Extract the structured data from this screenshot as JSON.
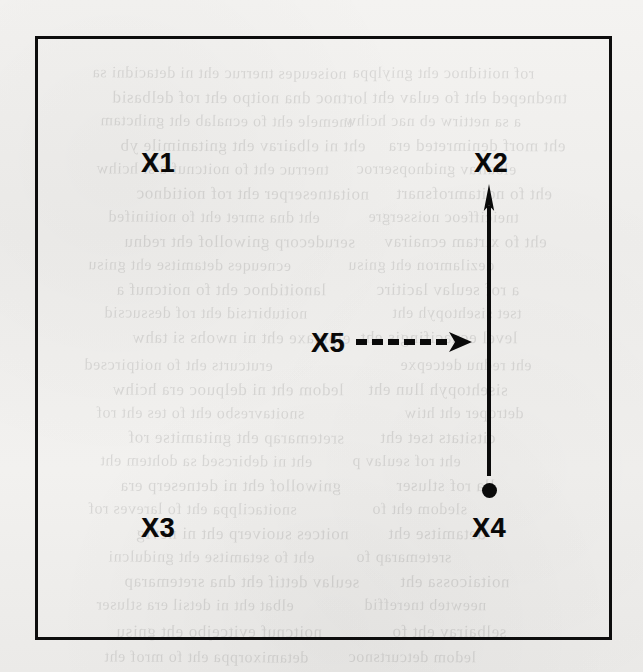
{
  "figure": {
    "background_color": "#f1f0ee",
    "border_color": "#0d0d0d",
    "ink_color": "#0a0a0a",
    "labels": [
      {
        "id": "x1",
        "text": "X1",
        "x": 155,
        "y": 160
      },
      {
        "id": "x2",
        "text": "X2",
        "x": 488,
        "y": 160
      },
      {
        "id": "x3",
        "text": "X3",
        "x": 155,
        "y": 525
      },
      {
        "id": "x4",
        "text": "X4",
        "x": 486,
        "y": 525
      },
      {
        "id": "x5",
        "text": "X5",
        "x": 325,
        "y": 340
      }
    ],
    "edges": [
      {
        "id": "solid-arrow",
        "style": "solid",
        "from": "X4",
        "to": "X2",
        "direction": "up"
      },
      {
        "id": "dashed-arrow",
        "style": "dashed",
        "from": "X5",
        "to": "solid-arrow",
        "direction": "right",
        "dash_count": 6
      }
    ],
    "point_marker": {
      "id": "x4-dot",
      "shape": "filled-circle",
      "x": 486,
      "y": 488
    }
  },
  "bleed_through": {
    "lines": [
      {
        "text": "noiseuqes tnerruc eht ni detacidni sa",
        "x": 92,
        "y": 64,
        "size": 16,
        "rot": -0.35
      },
      {
        "text": "lortnoc dna noitpo eht rof delbasid",
        "x": 112,
        "y": 88,
        "size": 17,
        "rot": -0.2
      },
      {
        "text": "tnemele eht fo ecnalab eht gnihctam",
        "x": 100,
        "y": 112,
        "size": 16,
        "rot": -0.4
      },
      {
        "text": "eht ni elbairav eht gnitanimile yb",
        "x": 120,
        "y": 136,
        "size": 17,
        "rot": -0.15
      },
      {
        "text": "tnerruc eht fo noitcnuf a si hcihw",
        "x": 96,
        "y": 160,
        "size": 16,
        "rot": -0.3
      },
      {
        "text": "noitatneserper eht rof noitidnoc",
        "x": 136,
        "y": 184,
        "size": 17,
        "rot": -0.25
      },
      {
        "text": "eht dna smret eht fo noitinifed",
        "x": 108,
        "y": 208,
        "size": 16,
        "rot": -0.35
      },
      {
        "text": "serudecorp gniwollof eht rednu",
        "x": 124,
        "y": 232,
        "size": 17,
        "rot": -0.2
      },
      {
        "text": "ecneuqes detamitse eht gnisu",
        "x": 88,
        "y": 256,
        "size": 16,
        "rot": -0.4
      },
      {
        "text": "lanoitidnoc eht fo noitcnuf a",
        "x": 116,
        "y": 280,
        "size": 17,
        "rot": -0.18
      },
      {
        "text": "noitubirtsid eht rof dessucsid",
        "x": 104,
        "y": 304,
        "size": 16,
        "rot": -0.32
      },
      {
        "text": "elpmaxe eht ni nwohs si tahw",
        "x": 132,
        "y": 328,
        "size": 17,
        "rot": -0.22
      },
      {
        "text": "erutcurts eht fo noitpircsed",
        "x": 84,
        "y": 356,
        "size": 16,
        "rot": -0.38
      },
      {
        "text": "ledom eht ni delpuoc era hcihw",
        "x": 112,
        "y": 380,
        "size": 17,
        "rot": -0.16
      },
      {
        "text": "snoitavresbo eht fo tes eht rof",
        "x": 96,
        "y": 404,
        "size": 16,
        "rot": -0.3
      },
      {
        "text": "sretemarap eht gnitamitse rof",
        "x": 128,
        "y": 428,
        "size": 17,
        "rot": -0.24
      },
      {
        "text": "eht ni debircsed sa dohtem eht",
        "x": 100,
        "y": 452,
        "size": 16,
        "rot": -0.36
      },
      {
        "text": "gniwollof eht ni detneserp era",
        "x": 120,
        "y": 476,
        "size": 17,
        "rot": -0.2
      },
      {
        "text": "snoitacilppa eht fo lareves rof",
        "x": 88,
        "y": 500,
        "size": 16,
        "rot": -0.34
      },
      {
        "text": "noitces suoiverp eht ni nevig",
        "x": 136,
        "y": 524,
        "size": 17,
        "rot": -0.18
      },
      {
        "text": "eht fo setamitse eht gnidulcni",
        "x": 108,
        "y": 548,
        "size": 16,
        "rot": -0.28
      },
      {
        "text": "seulav dettif eht dna sretemarap",
        "x": 124,
        "y": 572,
        "size": 17,
        "rot": -0.22
      },
      {
        "text": "elbat eht ni detsil era stluser",
        "x": 96,
        "y": 596,
        "size": 16,
        "rot": -0.33
      },
      {
        "text": "noitcnuf evitcejbo eht gnisu",
        "x": 116,
        "y": 622,
        "size": 17,
        "rot": -0.19
      },
      {
        "text": "detamixorppa eht fo mrof eht",
        "x": 104,
        "y": 648,
        "size": 16,
        "rot": -0.3
      },
      {
        "text": "rof noitidnoc eht gniylppa",
        "x": 352,
        "y": 64,
        "size": 16,
        "rot": -0.26
      },
      {
        "text": "tnedneped eht fo eulav eht",
        "x": 372,
        "y": 88,
        "size": 17,
        "rot": -0.2
      },
      {
        "text": "a sa nettirw eb nac hcihw",
        "x": 344,
        "y": 112,
        "size": 16,
        "rot": -0.36
      },
      {
        "text": "eht morf denimreted era",
        "x": 388,
        "y": 136,
        "size": 17,
        "rot": -0.14
      },
      {
        "text": "elbairav gnidnopserroc",
        "x": 356,
        "y": 160,
        "size": 16,
        "rot": -0.31
      },
      {
        "text": "eht fo noitamrofsnart",
        "x": 396,
        "y": 184,
        "size": 17,
        "rot": -0.23
      },
      {
        "text": "tneiciffeoc noissergre",
        "x": 368,
        "y": 208,
        "size": 16,
        "rot": -0.37
      },
      {
        "text": "eht fo xirtam ecnairav",
        "x": 384,
        "y": 232,
        "size": 17,
        "rot": -0.17
      },
      {
        "text": "dezilamron eht gnisu",
        "x": 348,
        "y": 256,
        "size": 16,
        "rot": -0.29
      },
      {
        "text": "a rof seulav lacitirc",
        "x": 376,
        "y": 280,
        "size": 17,
        "rot": -0.21
      },
      {
        "text": "tset sisehtopyh eht",
        "x": 392,
        "y": 304,
        "size": 16,
        "rot": -0.35
      },
      {
        "text": "level ecnacifingis eht",
        "x": 360,
        "y": 328,
        "size": 17,
        "rot": -0.18
      },
      {
        "text": "eht rednu detcepxe",
        "x": 400,
        "y": 356,
        "size": 16,
        "rot": -0.27
      },
      {
        "text": "sisehtopyh llun eht",
        "x": 368,
        "y": 380,
        "size": 17,
        "rot": -0.33
      },
      {
        "text": "detroper eht htiw",
        "x": 404,
        "y": 404,
        "size": 16,
        "rot": -0.15
      },
      {
        "text": "citsitats tset eht",
        "x": 380,
        "y": 428,
        "size": 17,
        "rot": -0.3
      },
      {
        "text": "eht rof seulav p",
        "x": 352,
        "y": 452,
        "size": 16,
        "rot": -0.24
      },
      {
        "text": "lla rof stluser",
        "x": 396,
        "y": 476,
        "size": 17,
        "rot": -0.36
      },
      {
        "text": "sledom eht fo",
        "x": 372,
        "y": 500,
        "size": 16,
        "rot": -0.2
      },
      {
        "text": "detamitse eht",
        "x": 388,
        "y": 524,
        "size": 17,
        "rot": -0.28
      },
      {
        "text": "sretemarap fo",
        "x": 356,
        "y": 548,
        "size": 16,
        "rot": -0.34
      },
      {
        "text": "noitaicossa eht",
        "x": 400,
        "y": 572,
        "size": 17,
        "rot": -0.16
      },
      {
        "text": "neewteb tnereffid",
        "x": 364,
        "y": 596,
        "size": 16,
        "rot": -0.31
      },
      {
        "text": "selbairav eht fo",
        "x": 392,
        "y": 622,
        "size": 17,
        "rot": -0.22
      },
      {
        "text": "ledom detcurtsnoc",
        "x": 348,
        "y": 648,
        "size": 16,
        "rot": -0.3
      }
    ]
  }
}
